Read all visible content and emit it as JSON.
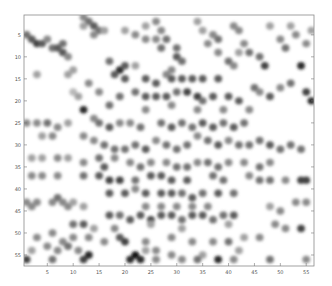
{
  "chart_data": {
    "type": "heatmap",
    "title": "",
    "xlabel": "",
    "ylabel": "",
    "colormap": "grayscale (white = 0, black = max)",
    "xlim": [
      0.5,
      56.5
    ],
    "ylim": [
      0.5,
      57.5
    ],
    "y_direction": "reversed",
    "grid": false,
    "legend": "none",
    "xticks": [
      5,
      10,
      15,
      20,
      25,
      30,
      35,
      40,
      45,
      50,
      55
    ],
    "yticks": [
      5,
      10,
      15,
      20,
      25,
      30,
      35,
      40,
      45,
      50,
      55
    ],
    "points_note": "approximate dark cells read from the image as [x, y, intensity 0-1]",
    "points": [
      [
        12,
        1,
        0.5
      ],
      [
        13,
        2,
        0.6
      ],
      [
        14,
        3,
        0.7
      ],
      [
        15,
        4,
        0.6
      ],
      [
        14,
        5,
        0.5
      ],
      [
        12,
        3,
        0.4
      ],
      [
        1,
        5,
        0.6
      ],
      [
        2,
        6,
        0.7
      ],
      [
        3,
        7,
        0.8
      ],
      [
        4,
        7,
        0.7
      ],
      [
        5,
        6,
        0.5
      ],
      [
        6,
        8,
        0.6
      ],
      [
        7,
        8,
        0.7
      ],
      [
        8,
        9,
        0.7
      ],
      [
        8,
        7,
        0.6
      ],
      [
        9,
        10,
        0.5
      ],
      [
        10,
        13,
        0.4
      ],
      [
        10,
        18,
        0.3
      ],
      [
        3,
        14,
        0.4
      ],
      [
        9,
        14,
        0.4
      ],
      [
        16,
        4,
        0.4
      ],
      [
        20,
        4,
        0.4
      ],
      [
        22,
        5,
        0.5
      ],
      [
        24,
        6,
        0.5
      ],
      [
        26,
        6,
        0.5
      ],
      [
        27,
        8,
        0.6
      ],
      [
        17,
        11,
        0.6
      ],
      [
        19,
        13,
        0.9
      ],
      [
        20,
        12,
        0.7
      ],
      [
        22,
        12,
        0.4
      ],
      [
        17,
        21,
        0.6
      ],
      [
        15,
        18,
        0.5
      ],
      [
        13,
        16,
        0.5
      ],
      [
        11,
        19,
        0.4
      ],
      [
        12,
        22,
        0.9
      ],
      [
        14,
        24,
        0.5
      ],
      [
        24,
        3,
        0.4
      ],
      [
        26,
        2,
        0.5
      ],
      [
        27,
        4,
        0.5
      ],
      [
        28,
        6,
        0.6
      ],
      [
        30,
        8,
        0.6
      ],
      [
        30,
        10,
        0.7
      ],
      [
        31,
        11,
        0.6
      ],
      [
        29,
        13,
        0.5
      ],
      [
        34,
        2,
        0.4
      ],
      [
        35,
        4,
        0.4
      ],
      [
        36,
        7,
        0.5
      ],
      [
        38,
        9,
        0.5
      ],
      [
        40,
        11,
        0.6
      ],
      [
        41,
        12,
        0.5
      ],
      [
        42,
        9,
        0.4
      ],
      [
        37,
        5,
        0.5
      ],
      [
        38,
        6,
        0.6
      ],
      [
        41,
        3,
        0.5
      ],
      [
        42,
        4,
        0.5
      ],
      [
        43,
        7,
        0.5
      ],
      [
        44,
        9,
        0.6
      ],
      [
        46,
        10,
        0.6
      ],
      [
        47,
        12,
        0.8
      ],
      [
        45,
        17,
        0.6
      ],
      [
        46,
        18,
        0.5
      ],
      [
        48,
        19,
        0.7
      ],
      [
        50,
        17,
        0.5
      ],
      [
        52,
        16,
        0.6
      ],
      [
        54,
        12,
        0.9
      ],
      [
        55,
        18,
        0.8
      ],
      [
        56,
        20,
        0.9
      ],
      [
        52,
        3,
        0.4
      ],
      [
        53,
        5,
        0.5
      ],
      [
        55,
        7,
        0.5
      ],
      [
        56,
        4,
        0.4
      ],
      [
        48,
        3,
        0.4
      ],
      [
        50,
        6,
        0.5
      ],
      [
        51,
        8,
        0.6
      ],
      [
        18,
        14,
        0.7
      ],
      [
        20,
        15,
        0.7
      ],
      [
        24,
        15,
        0.7
      ],
      [
        26,
        16,
        0.7
      ],
      [
        28,
        14,
        0.5
      ],
      [
        29,
        15,
        0.7
      ],
      [
        31,
        15,
        0.7
      ],
      [
        33,
        15,
        0.7
      ],
      [
        35,
        15,
        0.7
      ],
      [
        38,
        15,
        0.7
      ],
      [
        22,
        18,
        0.6
      ],
      [
        24,
        19,
        0.7
      ],
      [
        26,
        19,
        0.7
      ],
      [
        28,
        19,
        0.7
      ],
      [
        30,
        18,
        0.6
      ],
      [
        32,
        18,
        0.8
      ],
      [
        34,
        19,
        0.8
      ],
      [
        35,
        20,
        0.6
      ],
      [
        37,
        19,
        0.7
      ],
      [
        40,
        19,
        0.7
      ],
      [
        42,
        20,
        0.7
      ],
      [
        19,
        19,
        0.6
      ],
      [
        24,
        22,
        0.5
      ],
      [
        29,
        21,
        0.5
      ],
      [
        34,
        22,
        0.5
      ],
      [
        39,
        22,
        0.5
      ],
      [
        44,
        22,
        0.5
      ],
      [
        15,
        25,
        0.6
      ],
      [
        17,
        26,
        0.7
      ],
      [
        19,
        25,
        0.5
      ],
      [
        21,
        25,
        0.5
      ],
      [
        23,
        26,
        0.6
      ],
      [
        27,
        25,
        0.6
      ],
      [
        29,
        26,
        0.7
      ],
      [
        31,
        25,
        0.6
      ],
      [
        33,
        26,
        0.6
      ],
      [
        35,
        25,
        0.7
      ],
      [
        37,
        26,
        0.7
      ],
      [
        39,
        25,
        0.6
      ],
      [
        41,
        26,
        0.7
      ],
      [
        43,
        25,
        0.6
      ],
      [
        1,
        25,
        0.5
      ],
      [
        3,
        25,
        0.5
      ],
      [
        5,
        25,
        0.6
      ],
      [
        7,
        26,
        0.5
      ],
      [
        9,
        25,
        0.4
      ],
      [
        4,
        28,
        0.4
      ],
      [
        6,
        28,
        0.5
      ],
      [
        12,
        28,
        0.5
      ],
      [
        14,
        29,
        0.5
      ],
      [
        16,
        30,
        0.6
      ],
      [
        18,
        31,
        0.6
      ],
      [
        20,
        31,
        0.6
      ],
      [
        22,
        30,
        0.6
      ],
      [
        24,
        31,
        0.7
      ],
      [
        26,
        29,
        0.5
      ],
      [
        28,
        30,
        0.6
      ],
      [
        30,
        31,
        0.6
      ],
      [
        32,
        30,
        0.6
      ],
      [
        34,
        28,
        0.5
      ],
      [
        36,
        29,
        0.6
      ],
      [
        38,
        30,
        0.7
      ],
      [
        40,
        29,
        0.5
      ],
      [
        42,
        30,
        0.6
      ],
      [
        44,
        30,
        0.6
      ],
      [
        46,
        29,
        0.6
      ],
      [
        48,
        30,
        0.7
      ],
      [
        50,
        31,
        0.6
      ],
      [
        52,
        30,
        0.6
      ],
      [
        54,
        31,
        0.6
      ],
      [
        2,
        33,
        0.4
      ],
      [
        4,
        33,
        0.4
      ],
      [
        7,
        33,
        0.5
      ],
      [
        9,
        33,
        0.4
      ],
      [
        12,
        34,
        0.5
      ],
      [
        15,
        33,
        0.6
      ],
      [
        16,
        35,
        0.7
      ],
      [
        18,
        33,
        0.5
      ],
      [
        21,
        34,
        0.5
      ],
      [
        23,
        35,
        0.6
      ],
      [
        25,
        34,
        0.5
      ],
      [
        28,
        34,
        0.5
      ],
      [
        30,
        35,
        0.6
      ],
      [
        32,
        35,
        0.6
      ],
      [
        34,
        34,
        0.5
      ],
      [
        36,
        34,
        0.6
      ],
      [
        38,
        35,
        0.6
      ],
      [
        40,
        34,
        0.5
      ],
      [
        43,
        34,
        0.5
      ],
      [
        46,
        35,
        0.6
      ],
      [
        48,
        34,
        0.5
      ],
      [
        2,
        37,
        0.5
      ],
      [
        4,
        37,
        0.5
      ],
      [
        7,
        37,
        0.5
      ],
      [
        12,
        37,
        0.6
      ],
      [
        15,
        37,
        0.7
      ],
      [
        17,
        38,
        0.8
      ],
      [
        19,
        38,
        0.8
      ],
      [
        22,
        38,
        0.6
      ],
      [
        25,
        37,
        0.7
      ],
      [
        27,
        37,
        0.7
      ],
      [
        29,
        38,
        0.7
      ],
      [
        32,
        38,
        0.7
      ],
      [
        37,
        37,
        0.6
      ],
      [
        39,
        38,
        0.6
      ],
      [
        44,
        37,
        0.5
      ],
      [
        46,
        38,
        0.6
      ],
      [
        48,
        38,
        0.6
      ],
      [
        51,
        38,
        0.5
      ],
      [
        54,
        38,
        0.8
      ],
      [
        55,
        38,
        0.8
      ],
      [
        17,
        41,
        0.7
      ],
      [
        20,
        41,
        0.7
      ],
      [
        22,
        40,
        0.5
      ],
      [
        24,
        41,
        0.7
      ],
      [
        27,
        41,
        0.7
      ],
      [
        29,
        41,
        0.7
      ],
      [
        31,
        41,
        0.6
      ],
      [
        33,
        42,
        0.7
      ],
      [
        35,
        41,
        0.6
      ],
      [
        38,
        41,
        0.7
      ],
      [
        41,
        41,
        0.6
      ],
      [
        1,
        43,
        0.5
      ],
      [
        2,
        44,
        0.5
      ],
      [
        3,
        43,
        0.5
      ],
      [
        6,
        43,
        0.5
      ],
      [
        7,
        42,
        0.6
      ],
      [
        8,
        43,
        0.5
      ],
      [
        9,
        44,
        0.5
      ],
      [
        10,
        43,
        0.4
      ],
      [
        12,
        44,
        0.4
      ],
      [
        24,
        44,
        0.5
      ],
      [
        27,
        44,
        0.5
      ],
      [
        30,
        44,
        0.5
      ],
      [
        33,
        44,
        0.5
      ],
      [
        36,
        44,
        0.5
      ],
      [
        48,
        44,
        0.4
      ],
      [
        50,
        45,
        0.5
      ],
      [
        53,
        43,
        0.5
      ],
      [
        55,
        43,
        0.5
      ],
      [
        17,
        46,
        0.7
      ],
      [
        19,
        46,
        0.6
      ],
      [
        21,
        47,
        0.7
      ],
      [
        23,
        46,
        0.7
      ],
      [
        25,
        47,
        0.8
      ],
      [
        27,
        46,
        0.7
      ],
      [
        29,
        46,
        0.7
      ],
      [
        31,
        47,
        0.6
      ],
      [
        33,
        46,
        0.7
      ],
      [
        35,
        46,
        0.7
      ],
      [
        37,
        47,
        0.6
      ],
      [
        39,
        46,
        0.6
      ],
      [
        41,
        46,
        0.7
      ],
      [
        10,
        48,
        0.6
      ],
      [
        12,
        48,
        0.7
      ],
      [
        14,
        49,
        0.4
      ],
      [
        18,
        49,
        0.5
      ],
      [
        25,
        48,
        0.4
      ],
      [
        31,
        49,
        0.4
      ],
      [
        40,
        48,
        0.4
      ],
      [
        49,
        48,
        0.5
      ],
      [
        51,
        49,
        0.5
      ],
      [
        54,
        49,
        0.8
      ],
      [
        3,
        51,
        0.5
      ],
      [
        6,
        50,
        0.5
      ],
      [
        8,
        52,
        0.5
      ],
      [
        10,
        51,
        0.5
      ],
      [
        13,
        51,
        0.5
      ],
      [
        16,
        52,
        0.5
      ],
      [
        19,
        51,
        0.7
      ],
      [
        20,
        52,
        0.8
      ],
      [
        24,
        52,
        0.5
      ],
      [
        29,
        51,
        0.5
      ],
      [
        33,
        52,
        0.5
      ],
      [
        37,
        52,
        0.5
      ],
      [
        40,
        52,
        0.6
      ],
      [
        43,
        51,
        0.4
      ],
      [
        46,
        51,
        0.5
      ],
      [
        2,
        54,
        0.4
      ],
      [
        5,
        53,
        0.5
      ],
      [
        7,
        54,
        0.5
      ],
      [
        9,
        53,
        0.6
      ],
      [
        11,
        54,
        0.5
      ],
      [
        13,
        55,
        0.4
      ],
      [
        24,
        54,
        0.4
      ],
      [
        26,
        54,
        0.5
      ],
      [
        29,
        55,
        0.5
      ],
      [
        35,
        55,
        0.4
      ],
      [
        42,
        54,
        0.4
      ],
      [
        1,
        56,
        0.8
      ],
      [
        6,
        56,
        0.6
      ],
      [
        12,
        56,
        0.8
      ],
      [
        13,
        55,
        0.9
      ],
      [
        21,
        56,
        0.9
      ],
      [
        22,
        55,
        1.0
      ],
      [
        23,
        56,
        0.9
      ],
      [
        26,
        56,
        0.5
      ],
      [
        31,
        56,
        0.5
      ],
      [
        34,
        56,
        0.6
      ],
      [
        38,
        56,
        0.9
      ],
      [
        41,
        56,
        0.5
      ],
      [
        48,
        56,
        0.6
      ],
      [
        55,
        56,
        0.5
      ]
    ]
  },
  "axes": {
    "x_tick_labels": [
      "5",
      "10",
      "15",
      "20",
      "25",
      "30",
      "35",
      "40",
      "45",
      "50",
      "55"
    ],
    "y_tick_labels": [
      "5",
      "10",
      "15",
      "20",
      "25",
      "30",
      "35",
      "40",
      "45",
      "50",
      "55"
    ]
  }
}
